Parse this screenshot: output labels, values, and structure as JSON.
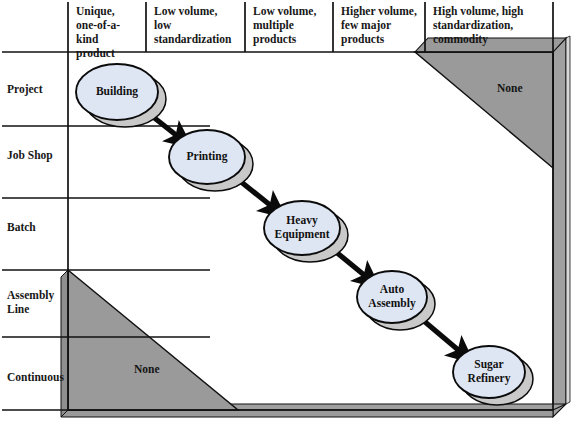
{
  "diagram": {
    "colors": {
      "node_fill": "#dfe6f3",
      "node_stroke": "#0b0b0b",
      "node_shadow": "#c9c9c9",
      "none_region_fill": "#9a9a9a",
      "frame_fill": "#9d9d9d",
      "frame_highlight": "#d2d2d2",
      "grid_line": "#111111",
      "text": "#171717",
      "background": "#ffffff"
    }
  },
  "columns": [
    {
      "id": "col-unique",
      "line1": "Unique,",
      "line2": "one-of-a-kind",
      "line3": "product"
    },
    {
      "id": "col-low-volume-low-std",
      "line1": "Low volume,",
      "line2": "low",
      "line3": "standardization"
    },
    {
      "id": "col-low-volume-multiple",
      "line1": "Low volume,",
      "line2": "multiple",
      "line3": "products"
    },
    {
      "id": "col-higher-volume",
      "line1": "Higher volume,",
      "line2": "few major",
      "line3": "products"
    },
    {
      "id": "col-high-volume-commodity",
      "line1": "High volume, high",
      "line2": "standardization,",
      "line3": "commodity"
    }
  ],
  "rows": [
    {
      "id": "row-project",
      "label": "Project"
    },
    {
      "id": "row-job-shop",
      "label": "Job Shop"
    },
    {
      "id": "row-batch",
      "label": "Batch"
    },
    {
      "id": "row-assembly-line",
      "label": "Assembly\nLine"
    },
    {
      "id": "row-continuous",
      "label": "Continuous"
    }
  ],
  "nodes": [
    {
      "id": "node-building",
      "label": "Building",
      "row": "Project",
      "column": "Unique, one-of-a-kind product",
      "cx": 117,
      "cy": 92,
      "rx": 41,
      "ry": 28
    },
    {
      "id": "node-printing",
      "label": "Printing",
      "row": "Job Shop",
      "column": "Low volume, low standardization",
      "cx": 207,
      "cy": 157,
      "rx": 38,
      "ry": 27
    },
    {
      "id": "node-heavy-equipment",
      "label": "Heavy\nEquipment",
      "row": "Batch",
      "column": "Low volume, multiple products",
      "cx": 302,
      "cy": 228,
      "rx": 38,
      "ry": 27
    },
    {
      "id": "node-auto-assembly",
      "label": "Auto\nAssembly",
      "row": "Assembly Line",
      "column": "Higher volume, few major products",
      "cx": 392,
      "cy": 297,
      "rx": 35,
      "ry": 26
    },
    {
      "id": "node-sugar-refinery",
      "label": "Sugar\nRefinery",
      "row": "Continuous",
      "column": "High volume, high standardization, commodity",
      "cx": 489,
      "cy": 372,
      "rx": 36,
      "ry": 26
    }
  ],
  "arrows": [
    {
      "id": "arrow-building-to-printing",
      "from": "Building",
      "to": "Printing"
    },
    {
      "id": "arrow-printing-to-heavy-equipment",
      "from": "Printing",
      "to": "Heavy Equipment"
    },
    {
      "id": "arrow-heavy-equipment-to-auto-assembly",
      "from": "Heavy Equipment",
      "to": "Auto Assembly"
    },
    {
      "id": "arrow-auto-assembly-to-sugar-refinery",
      "from": "Auto Assembly",
      "to": "Sugar Refinery"
    }
  ],
  "none_regions": [
    {
      "id": "none-upper-right",
      "label": "None",
      "position": "upper-right",
      "label_x": 497,
      "label_y": 89
    },
    {
      "id": "none-lower-left",
      "label": "None",
      "position": "lower-left",
      "label_x": 134,
      "label_y": 370
    }
  ]
}
